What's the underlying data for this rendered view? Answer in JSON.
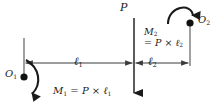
{
  "figure": {
    "background_color": "#ffffff",
    "stroke_color": "#1a1a1a",
    "labels": {
      "force": "P",
      "point_left": "O",
      "point_left_sub": "1",
      "point_right": "O",
      "point_right_sub": "2",
      "length_left": "ℓ",
      "length_left_sub": "1",
      "length_right": "ℓ",
      "length_right_sub": "2",
      "moment_left_symbol": "M",
      "moment_left_sub": "1",
      "moment_left_equals": " = ",
      "moment_left_force": "P",
      "moment_left_times": " × ",
      "moment_left_length": "ℓ",
      "moment_left_length_sub": "1",
      "moment_right_symbol": "M",
      "moment_right_sub": "2",
      "moment_right_equals": "= ",
      "moment_right_force": "P",
      "moment_right_times": " × ",
      "moment_right_length": "ℓ",
      "moment_right_length_sub": "2"
    },
    "geometry": {
      "left_extension_x": 24,
      "center_x": 134,
      "right_extension_x": 190,
      "dimension_line_y": 63,
      "force_arrow_top_y": 18,
      "force_arrow_bottom_y": 97
    },
    "icons": {
      "force_arrow": "down-arrow-icon",
      "moment_left_arc": "clockwise-moment-arc-icon",
      "moment_right_arc": "clockwise-moment-arc-icon",
      "dimension_left": "double-headed-dimension-arrow-icon",
      "dimension_right": "double-headed-dimension-arrow-icon",
      "pivot_left": "pivot-point-dot-icon",
      "pivot_right": "pivot-point-dot-icon"
    }
  }
}
